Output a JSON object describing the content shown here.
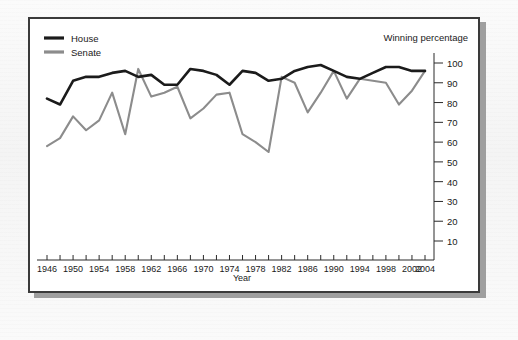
{
  "figure": {
    "header_title": "Winning percentage",
    "xlabel": "Year",
    "ylabel": "",
    "legend": [
      {
        "label": "House",
        "color": "#1b1b1b"
      },
      {
        "label": "Senate",
        "color": "#8c8c8c"
      }
    ]
  },
  "chart_data": {
    "type": "line",
    "title": "Winning percentage",
    "subtitle": "",
    "xlabel": "Year",
    "ylabel": "Winning percentage",
    "xlim": [
      1946,
      2004
    ],
    "ylim": [
      0,
      100
    ],
    "grid": false,
    "legend_position": "top-left",
    "x": [
      1946,
      1948,
      1950,
      1952,
      1954,
      1956,
      1958,
      1960,
      1962,
      1964,
      1966,
      1968,
      1970,
      1972,
      1974,
      1976,
      1978,
      1980,
      1982,
      1984,
      1986,
      1988,
      1990,
      1992,
      1994,
      1996,
      1998,
      2000,
      2002,
      2004
    ],
    "x_tick_labels": [
      "1946",
      "",
      "1950",
      "",
      "1954",
      "",
      "1958",
      "",
      "1962",
      "",
      "1966",
      "",
      "1970",
      "",
      "1974",
      "",
      "1978",
      "",
      "1982",
      "",
      "1986",
      "",
      "1990",
      "",
      "1994",
      "",
      "1998",
      "",
      "2002",
      "2004"
    ],
    "x_major_labels": [
      "1946",
      "1950",
      "1954",
      "1958",
      "1962",
      "1966",
      "1970",
      "1974",
      "1978",
      "1982",
      "1986",
      "1990",
      "1994",
      "1998",
      "2002",
      "2004"
    ],
    "y_tick_labels": [
      "10",
      "20",
      "30",
      "40",
      "50",
      "60",
      "70",
      "80",
      "90",
      "100"
    ],
    "y_ticks": [
      10,
      20,
      30,
      40,
      50,
      60,
      70,
      80,
      90,
      100
    ],
    "series": [
      {
        "name": "House",
        "color": "#1b1b1b",
        "values": [
          82,
          79,
          91,
          93,
          93,
          95,
          96,
          93,
          94,
          89,
          89,
          97,
          96,
          94,
          89,
          96,
          95,
          91,
          92,
          96,
          98,
          99,
          96,
          93,
          92,
          95,
          98,
          98,
          96,
          96
        ]
      },
      {
        "name": "Senate",
        "color": "#8c8c8c",
        "values": [
          58,
          62,
          73,
          66,
          71,
          85,
          64,
          97,
          83,
          85,
          88,
          72,
          77,
          84,
          85,
          64,
          60,
          55,
          93,
          90,
          75,
          85,
          96,
          82,
          92,
          91,
          90,
          79,
          86,
          96
        ]
      }
    ]
  }
}
